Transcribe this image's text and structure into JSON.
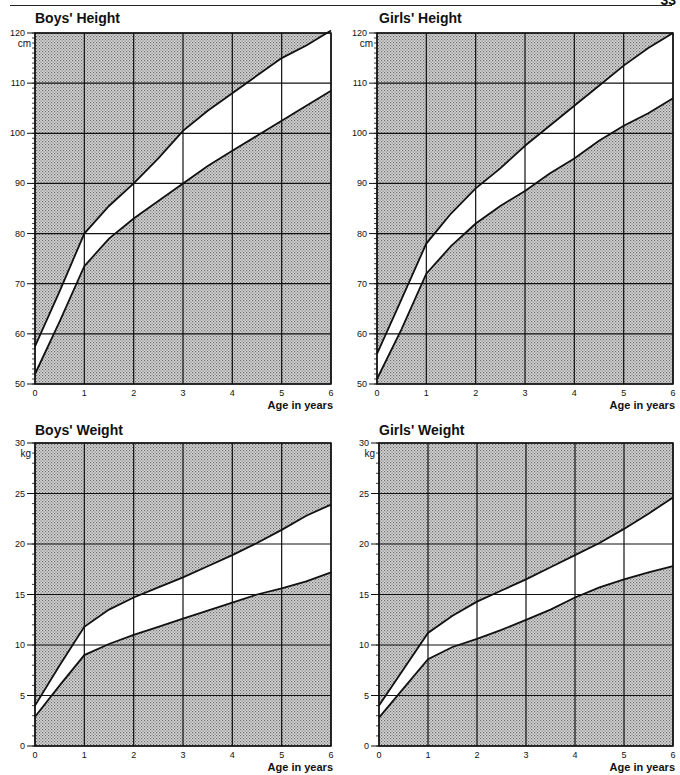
{
  "page": {
    "number": "33"
  },
  "chart_data": [
    {
      "type": "area",
      "title": "Boys' Height",
      "xlabel": "Age in years",
      "ylabel": "cm",
      "x_ticks": [
        0,
        1,
        2,
        3,
        4,
        5,
        6
      ],
      "y_ticks": [
        50,
        60,
        70,
        80,
        90,
        100,
        110,
        120
      ],
      "xlim": [
        0,
        6
      ],
      "ylim": [
        50,
        120
      ],
      "grid": true,
      "band": "unshaded region between lower and upper curve = normal range",
      "series": [
        {
          "name": "upper",
          "x": [
            0,
            0.5,
            1,
            1.5,
            2,
            2.5,
            3,
            3.5,
            4,
            4.5,
            5,
            5.5,
            6
          ],
          "values": [
            57.5,
            68.5,
            80,
            85.5,
            90,
            95,
            100.5,
            104.5,
            108,
            111.5,
            115,
            117.5,
            120.5
          ]
        },
        {
          "name": "lower",
          "x": [
            0,
            0.5,
            1,
            1.5,
            2,
            2.5,
            3,
            3.5,
            4,
            4.5,
            5,
            5.5,
            6
          ],
          "values": [
            52,
            62.5,
            73.5,
            79,
            83,
            86.5,
            90,
            93.5,
            96.5,
            99.5,
            102.5,
            105.5,
            108.5
          ]
        }
      ],
      "frame": {
        "left": 35,
        "right": 331,
        "top": 33,
        "bottom": 384
      }
    },
    {
      "type": "area",
      "title": "Girls' Height",
      "xlabel": "Age in years",
      "ylabel": "cm",
      "x_ticks": [
        0,
        1,
        2,
        3,
        4,
        5,
        6
      ],
      "y_ticks": [
        50,
        60,
        70,
        80,
        90,
        100,
        110,
        120
      ],
      "xlim": [
        0,
        6
      ],
      "ylim": [
        50,
        120
      ],
      "grid": true,
      "series": [
        {
          "name": "upper",
          "x": [
            0,
            0.5,
            1,
            1.5,
            2,
            2.5,
            3,
            3.5,
            4,
            4.5,
            5,
            5.5,
            6
          ],
          "values": [
            56,
            67,
            78,
            84,
            89,
            93,
            97.5,
            101.5,
            105.5,
            109.5,
            113.5,
            117,
            120
          ]
        },
        {
          "name": "lower",
          "x": [
            0,
            0.5,
            1,
            1.5,
            2,
            2.5,
            3,
            3.5,
            4,
            4.5,
            5,
            5.5,
            6
          ],
          "values": [
            51,
            61,
            72,
            77.5,
            82,
            85.5,
            88.5,
            92,
            95,
            98.5,
            101.5,
            104,
            107
          ]
        }
      ],
      "frame": {
        "left": 377,
        "right": 673,
        "top": 33,
        "bottom": 384
      }
    },
    {
      "type": "area",
      "title": "Boys' Weight",
      "xlabel": "Age in years",
      "ylabel": "kg",
      "x_ticks": [
        0,
        1,
        2,
        3,
        4,
        5,
        6
      ],
      "y_ticks": [
        0,
        5,
        10,
        15,
        20,
        25,
        30
      ],
      "xlim": [
        0,
        6
      ],
      "ylim": [
        0,
        30
      ],
      "grid": true,
      "series": [
        {
          "name": "upper",
          "x": [
            0,
            0.5,
            1,
            1.5,
            2,
            2.5,
            3,
            3.5,
            4,
            4.5,
            5,
            5.5,
            6
          ],
          "values": [
            4,
            8,
            11.8,
            13.5,
            14.7,
            15.7,
            16.7,
            17.8,
            18.9,
            20.1,
            21.4,
            22.8,
            23.9
          ]
        },
        {
          "name": "lower",
          "x": [
            0,
            0.5,
            1,
            1.5,
            2,
            2.5,
            3,
            3.5,
            4,
            4.5,
            5,
            5.5,
            6
          ],
          "values": [
            2.9,
            6,
            9,
            10.1,
            11,
            11.8,
            12.6,
            13.4,
            14.2,
            15,
            15.6,
            16.3,
            17.2
          ]
        }
      ],
      "frame": {
        "left": 35,
        "right": 331,
        "top": 443,
        "bottom": 746
      }
    },
    {
      "type": "area",
      "title": "Girls' Weight",
      "xlabel": "Age in years",
      "ylabel": "kg",
      "x_ticks": [
        0,
        1,
        2,
        3,
        4,
        5,
        6
      ],
      "y_ticks": [
        0,
        5,
        10,
        15,
        20,
        25,
        30
      ],
      "xlim": [
        0,
        6
      ],
      "ylim": [
        0,
        30
      ],
      "grid": true,
      "series": [
        {
          "name": "upper",
          "x": [
            0,
            0.5,
            1,
            1.5,
            2,
            2.5,
            3,
            3.5,
            4,
            4.5,
            5,
            5.5,
            6
          ],
          "values": [
            4,
            7.6,
            11.2,
            12.9,
            14.3,
            15.4,
            16.5,
            17.7,
            18.9,
            20.1,
            21.5,
            23,
            24.6
          ]
        },
        {
          "name": "lower",
          "x": [
            0,
            0.5,
            1,
            1.5,
            2,
            2.5,
            3,
            3.5,
            4,
            4.5,
            5,
            5.5,
            6
          ],
          "values": [
            2.8,
            5.7,
            8.6,
            9.8,
            10.6,
            11.5,
            12.5,
            13.5,
            14.7,
            15.7,
            16.5,
            17.2,
            17.8
          ]
        }
      ],
      "frame": {
        "left": 379,
        "right": 673,
        "top": 443,
        "bottom": 746
      }
    }
  ],
  "colors": {
    "shade": "#c9c9c9",
    "dots": "#6a6a6a",
    "line": "#111111",
    "band": "#ffffff"
  }
}
